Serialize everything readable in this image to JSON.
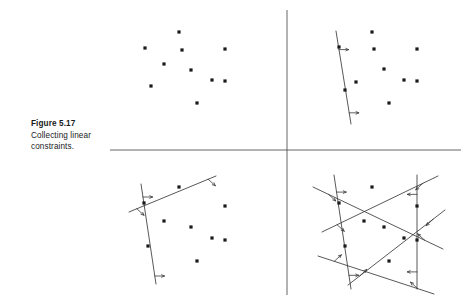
{
  "figure": {
    "caption_title": "Figure 5.17",
    "caption_line1": "Collecting linear",
    "caption_line2": "constraints.",
    "colors": {
      "ink": "#1a1a1a",
      "line": "#3a3a3a",
      "divider": "#555555",
      "background": "#ffffff"
    },
    "dividers": {
      "horizontal": {
        "x1": 110,
        "y1": 150,
        "x2": 461,
        "y2": 150
      },
      "vertical": {
        "x1": 287,
        "y1": 10,
        "x2": 287,
        "y2": 295
      }
    },
    "panels": [
      {
        "name": "top-left",
        "description": "Point set with no constraints",
        "points": [
          [
            179,
            32
          ],
          [
            145,
            48
          ],
          [
            182,
            50
          ],
          [
            225,
            49
          ],
          [
            191,
            70
          ],
          [
            164,
            64
          ],
          [
            151,
            86
          ],
          [
            212,
            80
          ],
          [
            225,
            81
          ],
          [
            197,
            103
          ]
        ],
        "lines": []
      },
      {
        "name": "top-right",
        "description": "Point set with one supporting line",
        "points": [
          [
            372,
            32
          ],
          [
            339,
            47
          ],
          [
            374,
            49
          ],
          [
            417,
            49
          ],
          [
            384,
            69
          ],
          [
            356,
            82
          ],
          [
            345,
            90
          ],
          [
            404,
            80
          ],
          [
            417,
            81
          ],
          [
            389,
            103
          ]
        ],
        "lines": [
          {
            "x1": 336,
            "y1": 31,
            "x2": 351,
            "y2": 124,
            "ticks": [
              {
                "t": 0.2,
                "dir": "right"
              },
              {
                "t": 0.88,
                "dir": "right"
              }
            ]
          }
        ]
      },
      {
        "name": "bottom-left",
        "description": "Point set with two supporting lines",
        "points": [
          [
            179,
            187
          ],
          [
            144,
            203
          ],
          [
            225,
            206
          ],
          [
            164,
            221
          ],
          [
            191,
            227
          ],
          [
            148,
            246
          ],
          [
            212,
            238
          ],
          [
            225,
            240
          ],
          [
            197,
            261
          ]
        ],
        "lines": [
          {
            "x1": 141,
            "y1": 184,
            "x2": 156,
            "y2": 284,
            "ticks": [
              {
                "t": 0.13,
                "dir": "right"
              },
              {
                "t": 0.92,
                "dir": "right"
              }
            ]
          },
          {
            "x1": 129,
            "y1": 212,
            "x2": 216,
            "y2": 176,
            "ticks": [
              {
                "t": 0.09,
                "dir": "down-right"
              },
              {
                "t": 0.91,
                "dir": "down-right"
              }
            ]
          }
        ]
      },
      {
        "name": "bottom-right",
        "description": "Point set enclosed by convex hull of six supporting lines",
        "points": [
          [
            372,
            187
          ],
          [
            339,
            203
          ],
          [
            417,
            206
          ],
          [
            364,
            221
          ],
          [
            384,
            227
          ],
          [
            345,
            246
          ],
          [
            404,
            238
          ],
          [
            417,
            240
          ],
          [
            389,
            261
          ]
        ],
        "lines": [
          {
            "x1": 313,
            "y1": 187,
            "x2": 443,
            "y2": 249,
            "ticks": [
              {
                "t": 0.12,
                "dir": "down-right"
              },
              {
                "t": 0.86,
                "dir": "up-left"
              }
            ]
          },
          {
            "x1": 322,
            "y1": 232,
            "x2": 438,
            "y2": 176,
            "ticks": [
              {
                "t": 0.13,
                "dir": "down-right"
              },
              {
                "t": 0.87,
                "dir": "down-left"
              }
            ]
          },
          {
            "x1": 334,
            "y1": 175,
            "x2": 351,
            "y2": 289,
            "ticks": [
              {
                "t": 0.15,
                "dir": "right"
              },
              {
                "t": 0.88,
                "dir": "right"
              }
            ]
          },
          {
            "x1": 417,
            "y1": 175,
            "x2": 417,
            "y2": 289,
            "ticks": [
              {
                "t": 0.17,
                "dir": "left"
              },
              {
                "t": 0.85,
                "dir": "left"
              }
            ]
          },
          {
            "x1": 348,
            "y1": 285,
            "x2": 445,
            "y2": 210,
            "ticks": [
              {
                "t": 0.12,
                "dir": "up-right"
              },
              {
                "t": 0.88,
                "dir": "down-left"
              }
            ]
          },
          {
            "x1": 318,
            "y1": 256,
            "x2": 434,
            "y2": 294,
            "ticks": [
              {
                "t": 0.14,
                "dir": "up-right"
              },
              {
                "t": 0.86,
                "dir": "up-left"
              }
            ]
          }
        ]
      }
    ]
  }
}
